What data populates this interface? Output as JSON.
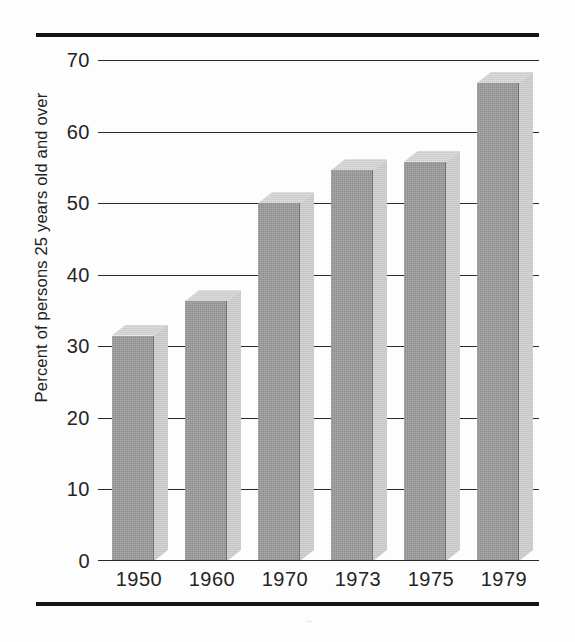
{
  "figure": {
    "background_color": "#fdfdfd",
    "rule_color": "#141414",
    "bar_front_color": "#8d8d8d",
    "bar_side_color": "#c6c6c6",
    "bar_top_color": "#cfcfcf",
    "gridline_color": "#2a2a2a",
    "speck": "··"
  },
  "chart_data": {
    "type": "bar",
    "title": "",
    "xlabel": "",
    "ylabel": "Percent of persons 25 years old and over",
    "categories": [
      "1950",
      "1960",
      "1970",
      "1973",
      "1975",
      "1979"
    ],
    "values": [
      31.5,
      36.3,
      50.0,
      54.6,
      55.8,
      66.8
    ],
    "ylim": [
      0,
      70
    ],
    "yticks": [
      0,
      10,
      20,
      30,
      40,
      50,
      60,
      70
    ],
    "ytick_labels": [
      "0",
      "10",
      "20",
      "30",
      "40",
      "50",
      "60",
      "70"
    ],
    "grid": true,
    "grid_axis": "y",
    "legend": null,
    "style": "3d-shaded-bars",
    "annotations": []
  }
}
